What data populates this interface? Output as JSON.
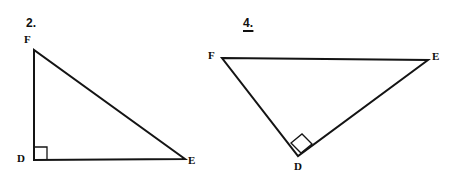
{
  "page": {
    "background_color": "#ffffff",
    "width": 457,
    "height": 185,
    "line_color": "#141414",
    "text_color": "#0d0d0d"
  },
  "figures": [
    {
      "id": "figure-2",
      "number_label": "2.",
      "underlined": false,
      "number_pos": {
        "x": 26,
        "y": 17
      },
      "shape": "triangle",
      "right_angle_at": "D",
      "vertices": [
        {
          "name": "F",
          "x": 34,
          "y": 50,
          "label_x": 24,
          "label_y": 34
        },
        {
          "name": "D",
          "x": 34,
          "y": 160,
          "label_x": 17,
          "label_y": 153
        },
        {
          "name": "E",
          "x": 185,
          "y": 159,
          "label_x": 188,
          "label_y": 155
        }
      ],
      "edges": [
        {
          "from": "F",
          "to": "D"
        },
        {
          "from": "D",
          "to": "E"
        },
        {
          "from": "E",
          "to": "F"
        }
      ],
      "right_angle_marker": {
        "type": "square",
        "points": "34,147 47,147 47,160"
      }
    },
    {
      "id": "figure-4",
      "number_label": "4.",
      "underlined": true,
      "number_pos": {
        "x": 243,
        "y": 17
      },
      "shape": "triangle",
      "right_angle_at": "D",
      "vertices": [
        {
          "name": "F",
          "x": 222,
          "y": 58,
          "label_x": 208,
          "label_y": 50
        },
        {
          "name": "E",
          "x": 428,
          "y": 60,
          "label_x": 432,
          "label_y": 51
        },
        {
          "name": "D",
          "x": 298,
          "y": 156,
          "label_x": 294,
          "label_y": 161
        }
      ],
      "edges": [
        {
          "from": "F",
          "to": "E"
        },
        {
          "from": "E",
          "to": "D"
        },
        {
          "from": "D",
          "to": "F"
        }
      ],
      "right_angle_marker": {
        "type": "rotated-square",
        "points": "291,143 302,134 312,144 301,153"
      }
    }
  ]
}
